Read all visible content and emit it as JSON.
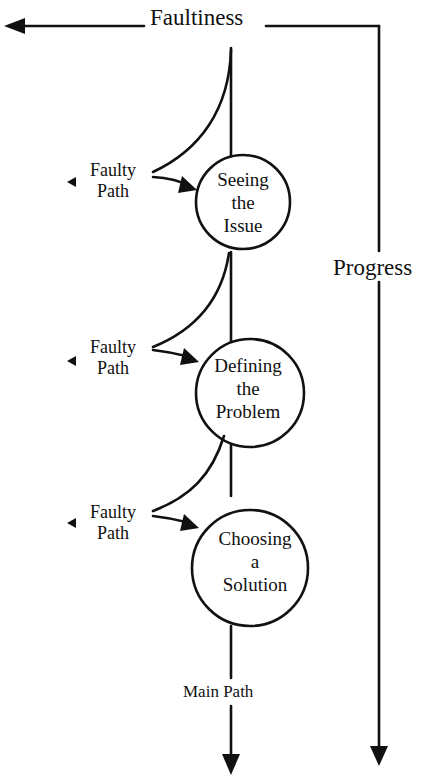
{
  "diagram": {
    "axes": {
      "horizontal_label": "Faultiness",
      "vertical_label": "Progress"
    },
    "main_path_label": "Main Path",
    "nodes": [
      {
        "line1": "Seeing",
        "line2": "the",
        "line3": "Issue"
      },
      {
        "line1": "Defining",
        "line2": "the",
        "line3": "Problem"
      },
      {
        "line1": "Choosing",
        "line2": "a",
        "line3": "Solution"
      }
    ],
    "faulty_paths": [
      {
        "line1": "Faulty",
        "line2": "Path"
      },
      {
        "line1": "Faulty",
        "line2": "Path"
      },
      {
        "line1": "Faulty",
        "line2": "Path"
      }
    ],
    "colors": {
      "ink": "#111111",
      "background": "#ffffff"
    }
  }
}
